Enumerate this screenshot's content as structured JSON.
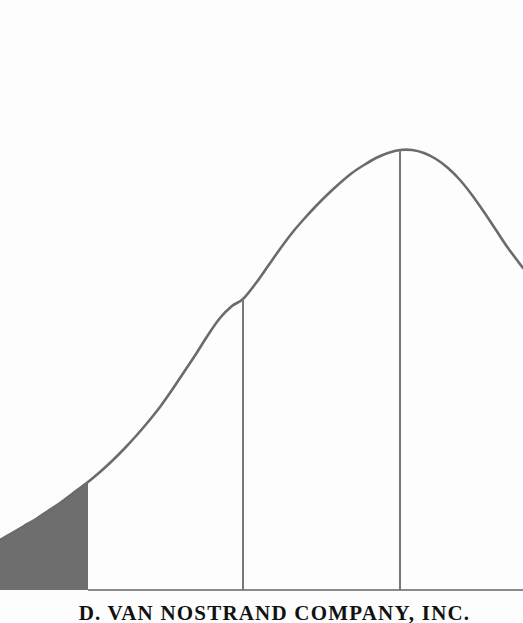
{
  "page": {
    "background_color": "#fdfdfd",
    "width": 523,
    "height": 623
  },
  "publisher": {
    "name": "D. VAN NOSTRAND COMPANY, INC.",
    "color": "#111111"
  },
  "colors": {
    "curve": "#6b6b6b",
    "tail_fill": "#6e6e6e",
    "axis": "#8a8a8a",
    "gridline": "#777777"
  },
  "chart_data": {
    "type": "line",
    "title": "",
    "subtitle": "",
    "xlabel": "",
    "ylabel": "",
    "grid": false,
    "legend": null,
    "axis": {
      "baseline_y": 590,
      "baseline_x_start": 88,
      "baseline_x_end": 523
    },
    "peak": {
      "x": 400,
      "y": 150
    },
    "xlim": [
      -3.4,
      0.85
    ],
    "ylim": [
      0,
      1.0
    ],
    "curve_points": [
      [
        0,
        540
      ],
      [
        12,
        533
      ],
      [
        24,
        526
      ],
      [
        36,
        519
      ],
      [
        48,
        511
      ],
      [
        60,
        503
      ],
      [
        72,
        494
      ],
      [
        88,
        482
      ],
      [
        100,
        472
      ],
      [
        112,
        461
      ],
      [
        124,
        449
      ],
      [
        136,
        436
      ],
      [
        148,
        422
      ],
      [
        160,
        407
      ],
      [
        172,
        390
      ],
      [
        184,
        372
      ],
      [
        196,
        354
      ],
      [
        208,
        335
      ],
      [
        220,
        318
      ],
      [
        232,
        306
      ],
      [
        243,
        299
      ],
      [
        256,
        283
      ],
      [
        268,
        266
      ],
      [
        280,
        249
      ],
      [
        292,
        233
      ],
      [
        304,
        219
      ],
      [
        316,
        206
      ],
      [
        328,
        194
      ],
      [
        340,
        183
      ],
      [
        352,
        173
      ],
      [
        364,
        165
      ],
      [
        376,
        158
      ],
      [
        388,
        153
      ],
      [
        400,
        150
      ],
      [
        412,
        150
      ],
      [
        424,
        153
      ],
      [
        436,
        159
      ],
      [
        448,
        168
      ],
      [
        460,
        180
      ],
      [
        472,
        195
      ],
      [
        484,
        212
      ],
      [
        496,
        230
      ],
      [
        508,
        248
      ],
      [
        523,
        268
      ]
    ],
    "shaded_region": {
      "label": "left tail",
      "x_from": 0,
      "x_to": 88,
      "fill": "#6e6e6e"
    },
    "vertical_lines": [
      {
        "x": 88,
        "y_top": 482,
        "y_bottom": 590
      },
      {
        "x": 243,
        "y_top": 299,
        "y_bottom": 590
      },
      {
        "x": 400,
        "y_top": 150,
        "y_bottom": 590
      }
    ]
  }
}
